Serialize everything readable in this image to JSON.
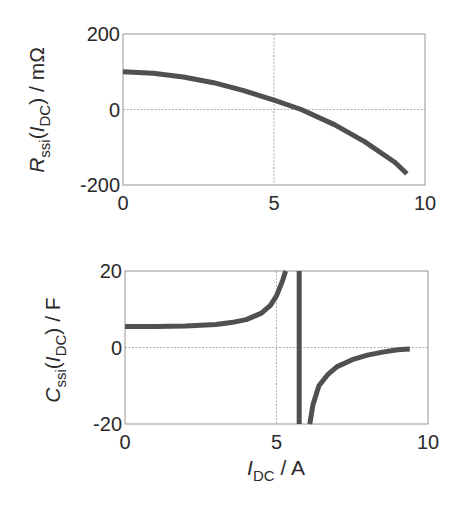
{
  "chart_data": [
    {
      "type": "line",
      "title": "",
      "xlabel": "",
      "ylabel": "R_ssi(I_DC) / mΩ",
      "ylabel_parts": {
        "main": "R",
        "sub": "ssi",
        "arg_main": "I",
        "arg_sub": "DC",
        "unit": " / mΩ"
      },
      "xlim": [
        0,
        10
      ],
      "ylim": [
        -200,
        200
      ],
      "xticks": [
        "0",
        "5",
        "10"
      ],
      "yticks": [
        "-200",
        "0",
        "200"
      ],
      "grid": true,
      "legend": null,
      "series": [
        {
          "name": "R_ssi",
          "x": [
            0,
            1,
            2,
            3,
            4,
            5,
            5.9,
            7,
            8,
            9,
            9.4
          ],
          "y": [
            100,
            96,
            86,
            71,
            50,
            25,
            0,
            -40,
            -85,
            -140,
            -170
          ]
        }
      ]
    },
    {
      "type": "line",
      "title": "",
      "xlabel": "I_DC / A",
      "xlabel_parts": {
        "main": "I",
        "sub": "DC",
        "unit": " / A"
      },
      "ylabel": "C_ssi(I_DC) / F",
      "ylabel_parts": {
        "main": "C",
        "sub": "ssi",
        "arg_main": "I",
        "arg_sub": "DC",
        "unit": " / F"
      },
      "xlim": [
        0,
        10
      ],
      "ylim": [
        -20,
        20
      ],
      "xticks": [
        "0",
        "5",
        "10"
      ],
      "yticks": [
        "-20",
        "0",
        "20"
      ],
      "grid": true,
      "legend": null,
      "annotations": [
        "Pole (vertical asymptote) near I_DC ≈ 5.75 A"
      ],
      "series": [
        {
          "name": "C_ssi (branch below pole)",
          "x": [
            0,
            1,
            2,
            3,
            3.5,
            4,
            4.5,
            4.8,
            5.0,
            5.2,
            5.3
          ],
          "y": [
            5.5,
            5.5,
            5.6,
            6.0,
            6.5,
            7.3,
            9.0,
            11.0,
            13.5,
            17.5,
            20
          ]
        },
        {
          "name": "C_ssi (pole line)",
          "x": [
            5.75,
            5.75
          ],
          "y": [
            20,
            -20
          ]
        },
        {
          "name": "C_ssi (branch above pole)",
          "x": [
            6.1,
            6.2,
            6.4,
            6.7,
            7.0,
            7.5,
            8.0,
            8.5,
            9.0,
            9.4
          ],
          "y": [
            -20,
            -15,
            -10,
            -7,
            -5,
            -3.2,
            -2,
            -1.2,
            -0.6,
            -0.4
          ]
        }
      ]
    }
  ]
}
